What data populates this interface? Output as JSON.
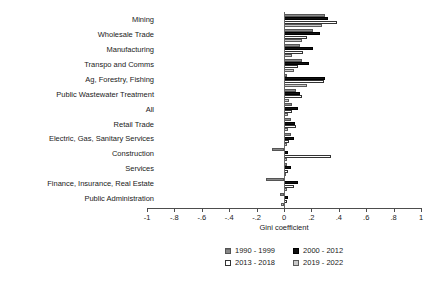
{
  "chart_data": {
    "type": "bar",
    "orientation": "horizontal",
    "title": "",
    "xlabel": "Gini coefficient",
    "ylabel": "",
    "xlim": [
      -1,
      1
    ],
    "xticks": [
      "-1",
      "-.8",
      "-.6",
      "-.4",
      "-.2",
      "0",
      ".2",
      ".4",
      ".6",
      ".8",
      "1"
    ],
    "xtick_values": [
      -1,
      -0.8,
      -0.6,
      -0.4,
      -0.2,
      0,
      0.2,
      0.4,
      0.6,
      0.8,
      1
    ],
    "grid": false,
    "legend_position": "bottom",
    "categories": [
      "Mining",
      "Wholesale Trade",
      "Manufacturing",
      "Transpo and Comms",
      "Ag, Forestry, Fishing",
      "Public Wastewater Treatment",
      "All",
      "Retail Trade",
      "Electric, Gas, Sanitary Services",
      "Construction",
      "Services",
      "Finance, Insurance, Real Estate",
      "Public Administration"
    ],
    "series": [
      {
        "name": "1990 - 1999",
        "color": "#888888",
        "values": [
          0.3,
          0.21,
          0.12,
          0.13,
          0.02,
          0.09,
          0.06,
          0.05,
          0.05,
          -0.09,
          0.02,
          -0.13,
          -0.03
        ]
      },
      {
        "name": "2000 - 2012",
        "color": "#111111",
        "values": [
          0.32,
          0.26,
          0.21,
          0.18,
          0.3,
          0.12,
          0.1,
          0.08,
          0.07,
          0.03,
          0.05,
          0.1,
          0.03
        ]
      },
      {
        "name": "2013 - 2018",
        "color": "#ffffff",
        "values": [
          0.39,
          0.17,
          0.14,
          0.1,
          0.29,
          0.13,
          0.06,
          0.09,
          0.04,
          0.34,
          0.03,
          0.07,
          0.02
        ]
      },
      {
        "name": "2019 - 2022",
        "color": "#c9c9c9",
        "values": [
          0.28,
          0.13,
          0.06,
          0.07,
          0.17,
          0.04,
          0.03,
          0.03,
          0.02,
          0.02,
          0.01,
          0.02,
          -0.02
        ]
      }
    ]
  },
  "legend": {
    "items": [
      {
        "label": "1990 - 1999",
        "swatch": "series-0-swatch"
      },
      {
        "label": "2000 - 2012",
        "swatch": "series-1-swatch"
      },
      {
        "label": "2013 - 2018",
        "swatch": "series-2-swatch"
      },
      {
        "label": "2019 - 2022",
        "swatch": "series-3-swatch"
      }
    ]
  }
}
